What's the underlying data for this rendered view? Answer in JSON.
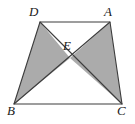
{
  "figure": {
    "type": "geometry-diagram",
    "background_color": "#ffffff",
    "shade_color": "#ababab",
    "stroke_color": "#3c3c3c",
    "stroke_width": 1.1,
    "canvas": {
      "width": 135,
      "height": 124
    }
  },
  "points": {
    "D": {
      "label": "D",
      "x": 40,
      "y": 22,
      "label_x": 29,
      "label_y": 5
    },
    "A": {
      "label": "A",
      "x": 110,
      "y": 22,
      "label_x": 105,
      "label_y": 5
    },
    "B": {
      "label": "B",
      "x": 14,
      "y": 104,
      "label_x": 8,
      "label_y": 104
    },
    "C": {
      "label": "C",
      "x": 122,
      "y": 104,
      "label_x": 118,
      "label_y": 104
    },
    "E": {
      "label": "E",
      "x": 70,
      "y": 58,
      "label_x": 64,
      "label_y": 40
    }
  },
  "segments": [
    {
      "name": "DA",
      "from": "D",
      "to": "A"
    },
    {
      "name": "AC",
      "from": "A",
      "to": "C"
    },
    {
      "name": "CB",
      "from": "C",
      "to": "B"
    },
    {
      "name": "BD",
      "from": "B",
      "to": "D"
    },
    {
      "name": "DC",
      "from": "D",
      "to": "C"
    },
    {
      "name": "AB",
      "from": "A",
      "to": "B"
    }
  ],
  "shaded_regions": [
    {
      "name": "triangle-DEB",
      "vertices": "D,E,B"
    },
    {
      "name": "triangle-AEC",
      "vertices": "A,E,C"
    }
  ],
  "unshaded_regions": [
    {
      "name": "triangle-DAE",
      "vertices": "D,A,E"
    },
    {
      "name": "triangle-BEC",
      "vertices": "B,E,C"
    }
  ],
  "paths": {
    "outline": "M 40 22 L 110 22 L 122 104 L 14 104 Z",
    "diagonal_DC": "M 40 22 L 122 104",
    "diagonal_AB": "M 110 22 L 14 104",
    "shade_left": "M 40 22 L 70 58 L 14 104 Z",
    "shade_right": "M 110 22 L 70 58 L 122 104 Z"
  }
}
